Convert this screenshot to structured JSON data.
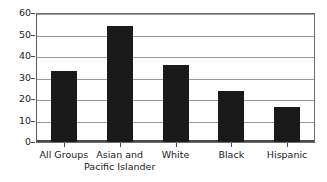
{
  "chart_data": {
    "type": "bar",
    "title": "",
    "subtitle": "",
    "xlabel": "",
    "ylabel": "",
    "categories": [
      "All Groups",
      "Asian and Pacific Islander",
      "White",
      "Black",
      "Hispanic"
    ],
    "category_lines": [
      [
        "All Groups"
      ],
      [
        "Asian and",
        "Pacific Islander"
      ],
      [
        "White"
      ],
      [
        "Black"
      ],
      [
        "Hispanic"
      ]
    ],
    "values": [
      33,
      54,
      36,
      23.5,
      16.5
    ],
    "ylim": [
      0,
      60
    ],
    "ytick_labels": [
      "0",
      "10",
      "20",
      "30",
      "40",
      "50",
      "60"
    ],
    "ytick_values": [
      0,
      10,
      20,
      30,
      40,
      50,
      60
    ],
    "grid": true,
    "legend": false,
    "legend_position": "none",
    "bar_color": "#1a1a1a",
    "gridline_color": "#9a9a9a",
    "axis_color": "#4a4a4a",
    "plot_border_color": "#6e6e6e",
    "background_color": "#ffffff"
  }
}
